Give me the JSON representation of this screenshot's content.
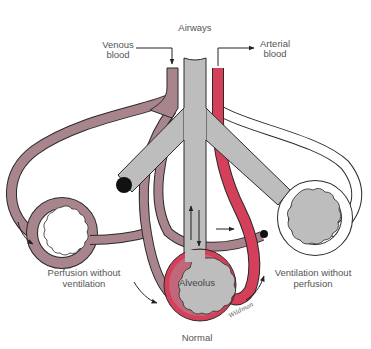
{
  "diagram": {
    "labels": {
      "airways": "Airways",
      "venous_line1": "Venous",
      "venous_line2": "blood",
      "arterial_line1": "Arterial",
      "arterial_line2": "blood",
      "perfusion_line1": "Perfusion without",
      "perfusion_line2": "ventilation",
      "ventilation_line1": "Ventilation without",
      "ventilation_line2": "perfusion",
      "alveolus": "Alveolus",
      "normal": "Normal",
      "signature": "Wildman"
    },
    "units": [
      {
        "name": "Perfusion without ventilation",
        "airway": "blocked",
        "blood_flow": "present",
        "alveolus_fill": "empty"
      },
      {
        "name": "Normal",
        "airway": "open",
        "blood_flow": "present",
        "alveolus_fill": "air"
      },
      {
        "name": "Ventilation without perfusion",
        "airway": "open",
        "blood_flow": "blocked",
        "alveolus_fill": "air"
      }
    ],
    "colors": {
      "venous": "#a8858d",
      "venous_dark": "#8f6a73",
      "arterial": "#d4405a",
      "arterial_dark": "#b82845",
      "airway": "#bdbdbd",
      "outline": "#2a2a2a",
      "blockage": "#111111",
      "label_text": "#555555"
    }
  }
}
